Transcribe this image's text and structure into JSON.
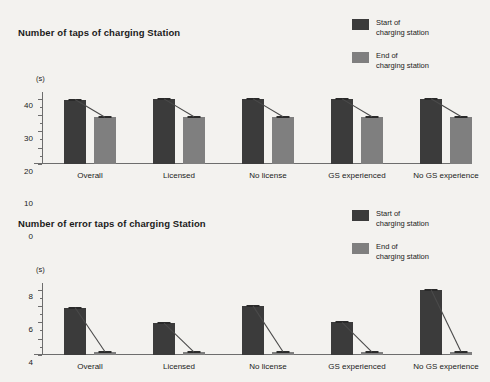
{
  "legend": {
    "items": [
      {
        "label": "Start of\ncharging station",
        "swatch": "start-swatch",
        "color": "#3b3b3b"
      },
      {
        "label": "End of\ncharging station",
        "swatch": "end-swatch",
        "color": "#7f7f7f"
      }
    ]
  },
  "chart_data": [
    {
      "type": "bar",
      "title": "Number of taps of charging Station",
      "xlabel": "",
      "ylabel": "(s)",
      "ylim": [
        0,
        44
      ],
      "yticks": [
        0,
        10,
        20,
        30,
        40
      ],
      "ytick_labels": [
        "0",
        "10",
        "20",
        "30",
        "40"
      ],
      "grid": false,
      "legend_position": "top-right",
      "categories": [
        "Overall",
        "Licensed",
        "No license",
        "GS experienced",
        "No GS experience"
      ],
      "series": [
        {
          "name": "Start of charging station",
          "color": "#3b3b3b",
          "values": [
            39.4,
            39.8,
            39.8,
            39.8,
            39.9
          ]
        },
        {
          "name": "End of charging station",
          "color": "#7f7f7f",
          "values": [
            28.6,
            28.9,
            28.9,
            28.9,
            29.0
          ]
        }
      ]
    },
    {
      "type": "bar",
      "title": "Number of error taps of charging Station",
      "xlabel": "",
      "ylabel": "(s)",
      "ylim": [
        0,
        8.8
      ],
      "yticks": [
        0,
        2,
        4,
        6,
        8
      ],
      "ytick_labels": [
        "0",
        "2",
        "4",
        "6",
        "8"
      ],
      "grid": false,
      "legend_position": "top-right",
      "categories": [
        "Overall",
        "Licensed",
        "No license",
        "GS experienced",
        "No GS experience"
      ],
      "series": [
        {
          "name": "Start of charging station",
          "color": "#3b3b3b",
          "values": [
            5.8,
            3.9,
            6.0,
            4.0,
            8.0
          ]
        },
        {
          "name": "End of charging station",
          "color": "#7f7f7f",
          "values": [
            0.4,
            0.35,
            0.4,
            0.35,
            0.4
          ]
        }
      ]
    }
  ]
}
